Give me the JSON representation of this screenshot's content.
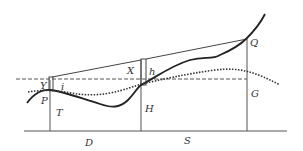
{
  "diagram": {
    "labels": {
      "Y": "Y",
      "i": "i",
      "P": "P",
      "T": "T",
      "D": "D",
      "X": "X",
      "h": "h",
      "H": "H",
      "S": "S",
      "Q": "Q",
      "G": "G"
    },
    "colors": {
      "line": "#444444",
      "curve": "#222222",
      "background": "#ffffff"
    }
  }
}
